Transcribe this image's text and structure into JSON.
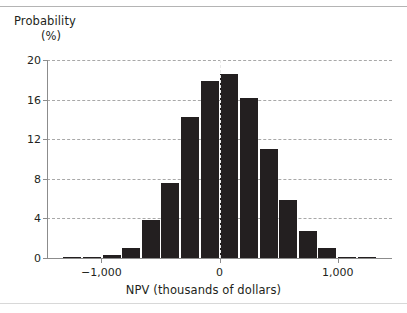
{
  "figure": {
    "background_color": "#ffffff",
    "bar_color": "#231f20",
    "grid_color": "#9a9a9a",
    "axis_color": "#8c8c8c",
    "zero_line_color": "#e8e8e8"
  },
  "chart_data": {
    "type": "bar",
    "title": "",
    "subtitle": "",
    "xlabel": "NPV (thousands of dollars)",
    "ylabel_line1": "Probability",
    "ylabel_line2": "(%)",
    "ylabel": "Probability (%)",
    "grid": true,
    "grid_axis": "y",
    "legend": null,
    "legend_position": "none",
    "xlim": [
      -1460,
      1460
    ],
    "ylim": [
      0,
      20
    ],
    "yticks": [
      0,
      4,
      8,
      12,
      16,
      20
    ],
    "ytick_labels": [
      "0",
      "4",
      "8",
      "12",
      "16",
      "20"
    ],
    "xticks": [
      -1000,
      0,
      1000
    ],
    "xtick_labels": [
      "−1,000",
      "0",
      "1,000"
    ],
    "bin_width": 166,
    "annotations": [
      {
        "name": "zero-reference-line",
        "type": "vline",
        "x": 0,
        "style": "dashed",
        "color": "#e8e8e8"
      }
    ],
    "x": [
      -1245,
      -1079,
      -913,
      -747,
      -581,
      -415,
      -249,
      -83,
      83,
      249,
      415,
      581,
      747,
      913,
      1079,
      1245
    ],
    "bin_centers": [
      -1245,
      -1079,
      -913,
      -747,
      -581,
      -415,
      -249,
      -83,
      83,
      249,
      415,
      581,
      747,
      913,
      1079,
      1245
    ],
    "categories": [
      "-1245",
      "-1079",
      "-913",
      "-747",
      "-581",
      "-415",
      "-249",
      "-83",
      "83",
      "249",
      "415",
      "581",
      "747",
      "913",
      "1079",
      "1245"
    ],
    "values": [
      0.1,
      0.1,
      0.3,
      1.0,
      3.8,
      7.6,
      14.2,
      17.9,
      18.6,
      16.2,
      11.0,
      5.9,
      2.7,
      1.0,
      0.15,
      0.15
    ]
  }
}
